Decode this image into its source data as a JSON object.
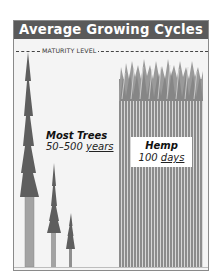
{
  "title": "Average Growing Cycles",
  "maturity_line": {
    "label": "MATURITY LEVEL"
  },
  "trees": {
    "name": "Most Trees",
    "range": "50–500",
    "unit": "years",
    "icon": "tree-icon",
    "count": 3
  },
  "hemp": {
    "name": "Hemp",
    "value": "100",
    "unit": "days",
    "icon": "hemp-stalks-icon"
  },
  "colors": {
    "header_bg": "#5a5a5a",
    "header_text": "#ffffff",
    "panel_bg": "#f4f4f4",
    "foliage": "#5e5e5e",
    "trunk": "#a3a3a3",
    "hemp_stalk": "#8c8c8c"
  }
}
